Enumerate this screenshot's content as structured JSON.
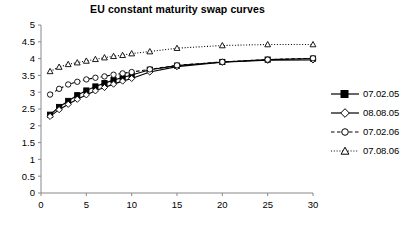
{
  "chart_data": {
    "type": "line",
    "title": "EU constant maturity swap curves",
    "xlabel": "",
    "ylabel": "",
    "xlim": [
      0,
      30
    ],
    "ylim": [
      0,
      5
    ],
    "xticks": [
      0,
      5,
      10,
      15,
      20,
      25,
      30
    ],
    "yticks": [
      0,
      0.5,
      1,
      1.5,
      2,
      2.5,
      3,
      3.5,
      4,
      4.5,
      5
    ],
    "ytick_labels": [
      "0",
      "0.5",
      "1",
      "1.5",
      "2",
      "2.5",
      "3",
      "3.5",
      "4",
      "4.5",
      "5"
    ],
    "xtick_labels": [
      "0",
      "5",
      "10",
      "15",
      "20",
      "25",
      "30"
    ],
    "grid": false,
    "legend_position": "right",
    "x": [
      1,
      2,
      3,
      4,
      5,
      6,
      7,
      8,
      9,
      10,
      12,
      15,
      20,
      25,
      30
    ],
    "series": [
      {
        "name": "07.02.05",
        "marker": "filled-square",
        "line": "solid",
        "color": "#000000",
        "values": [
          2.33,
          2.56,
          2.74,
          2.91,
          3.05,
          3.17,
          3.27,
          3.36,
          3.44,
          3.51,
          3.67,
          3.79,
          3.9,
          3.97,
          4.0
        ]
      },
      {
        "name": "08.08.05",
        "marker": "open-diamond",
        "line": "solid",
        "color": "#000000",
        "values": [
          2.28,
          2.48,
          2.64,
          2.79,
          2.92,
          3.04,
          3.14,
          3.24,
          3.33,
          3.41,
          3.6,
          3.76,
          3.89,
          3.95,
          3.96
        ]
      },
      {
        "name": "07.02.06",
        "marker": "open-circle",
        "line": "dashed",
        "color": "#000000",
        "values": [
          2.93,
          3.1,
          3.23,
          3.31,
          3.38,
          3.43,
          3.47,
          3.52,
          3.56,
          3.6,
          3.68,
          3.8,
          3.9,
          3.97,
          4.01
        ]
      },
      {
        "name": "07.08.06",
        "marker": "open-triangle",
        "line": "dotted",
        "color": "#000000",
        "values": [
          3.62,
          3.75,
          3.83,
          3.88,
          3.93,
          3.98,
          4.03,
          4.07,
          4.1,
          4.15,
          4.21,
          4.31,
          4.39,
          4.42,
          4.42
        ]
      }
    ]
  },
  "legend": {
    "items": [
      {
        "label": "07.02.05"
      },
      {
        "label": "08.08.05"
      },
      {
        "label": "07.02.06"
      },
      {
        "label": "07.08.06"
      }
    ]
  }
}
